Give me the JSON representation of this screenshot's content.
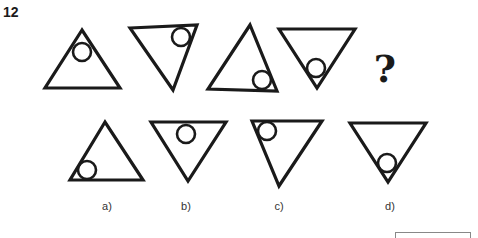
{
  "question": {
    "number": "12",
    "sequence_placeholder": "?"
  },
  "sequence": [
    {
      "orientation": "up",
      "points": "82,30 45,88 120,88",
      "circle": {
        "cx": 82,
        "cy": 52,
        "r": 9
      }
    },
    {
      "orientation": "down",
      "points": "130,28 197,25 173,90",
      "circle": {
        "cx": 181,
        "cy": 37,
        "r": 9
      }
    },
    {
      "orientation": "up",
      "points": "250,25 208,89 277,91",
      "circle": {
        "cx": 262,
        "cy": 80,
        "r": 9
      }
    },
    {
      "orientation": "down",
      "points": "279,29 355,29 317,88",
      "circle": {
        "cx": 316,
        "cy": 68,
        "r": 9
      }
    }
  ],
  "options": [
    {
      "label": "a)",
      "label_x": 107,
      "points": "105,122 70,180 143,180",
      "circle": {
        "cx": 87,
        "cy": 170,
        "r": 9
      }
    },
    {
      "label": "b)",
      "label_x": 186,
      "points": "151,122 226,122 188,181",
      "circle": {
        "cx": 186,
        "cy": 134,
        "r": 9
      }
    },
    {
      "label": "c)",
      "label_x": 279,
      "points": "252,121 322,121 279,186",
      "circle": {
        "cx": 267,
        "cy": 131,
        "r": 9
      }
    },
    {
      "label": "d)",
      "label_x": 390,
      "points": "350,123 426,123 388,182",
      "circle": {
        "cx": 387,
        "cy": 163,
        "r": 9
      }
    }
  ],
  "colors": {
    "stroke": "#1a1a1a",
    "background": "#ffffff"
  }
}
